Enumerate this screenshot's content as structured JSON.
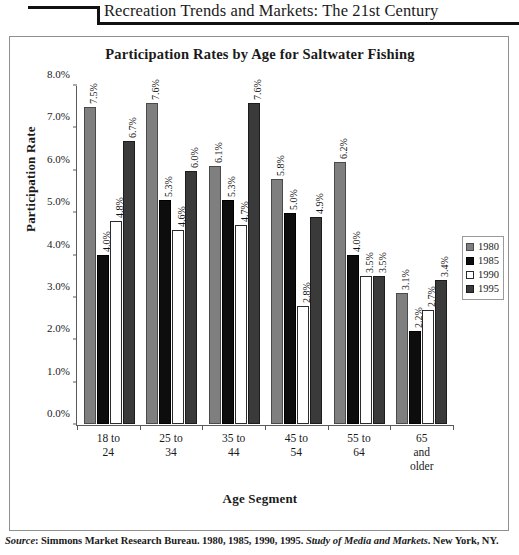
{
  "header": {
    "running_title": "Recreation Trends and Markets: The 21st Century"
  },
  "footer": {
    "source_label": "Source",
    "source_colon": ": ",
    "source_body": "Simmons Market Research Bureau. 1980, 1985, 1990, 1995. ",
    "source_publication": "Study of Media and Markets",
    "source_tail": ". New York, NY."
  },
  "legend": {
    "position": "right",
    "entries": [
      "1980",
      "1985",
      "1990",
      "1995"
    ]
  },
  "colors": {
    "series_1980": "#7f7f7f",
    "series_1985": "#0d0d0d",
    "series_1990": "#ffffff",
    "series_1995": "#3a3a3a",
    "axis": "#5a5a5a",
    "frame": "#8f8f8f",
    "text": "#1a1a1a"
  },
  "chart_data": {
    "type": "bar",
    "title": "Participation Rates by Age for Saltwater Fishing",
    "xlabel": "Age Segment",
    "ylabel": "Participation Rate",
    "grid": false,
    "legend_position": "right",
    "ylim": [
      0,
      8
    ],
    "ytick_labels": [
      "0.0%",
      "1.0%",
      "2.0%",
      "3.0%",
      "4.0%",
      "5.0%",
      "6.0%",
      "7.0%",
      "8.0%"
    ],
    "ytick_values": [
      0,
      1,
      2,
      3,
      4,
      5,
      6,
      7,
      8
    ],
    "categories": [
      "18 to\n24",
      "25 to\n34",
      "35 to\n44",
      "45 to\n54",
      "55 to\n64",
      "65\nand\nolder"
    ],
    "category_lines": [
      [
        "18 to",
        "24"
      ],
      [
        "25 to",
        "34"
      ],
      [
        "35 to",
        "44"
      ],
      [
        "45 to",
        "54"
      ],
      [
        "55 to",
        "64"
      ],
      [
        "65",
        "and",
        "older"
      ]
    ],
    "series": [
      {
        "name": "1980",
        "values": [
          7.5,
          7.6,
          6.1,
          5.8,
          6.2,
          3.1
        ],
        "labels": [
          "7.5%",
          "7.6%",
          "6.1%",
          "5.8%",
          "6.2%",
          "3.1%"
        ]
      },
      {
        "name": "1985",
        "values": [
          4.0,
          5.3,
          5.3,
          5.0,
          4.0,
          2.2
        ],
        "labels": [
          "4.0%",
          "5.3%",
          "5.3%",
          "5.0%",
          "4.0%",
          "2.2%"
        ]
      },
      {
        "name": "1990",
        "values": [
          4.8,
          4.6,
          4.7,
          2.8,
          3.5,
          2.7
        ],
        "labels": [
          "4.8%",
          "4.6%",
          "4.7%",
          "2.8%",
          "3.5%",
          "2.7%"
        ]
      },
      {
        "name": "1995",
        "values": [
          6.7,
          6.0,
          7.6,
          4.9,
          3.5,
          3.4
        ],
        "labels": [
          "6.7%",
          "6.0%",
          "7.6%",
          "4.9%",
          "3.5%",
          "3.4%"
        ]
      }
    ]
  }
}
